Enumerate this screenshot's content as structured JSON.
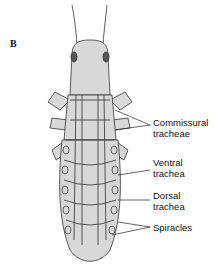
{
  "figure": {
    "panel_label": "B",
    "labels": [
      {
        "id": "commissural",
        "line1": "Commissural",
        "line2": "tracheae"
      },
      {
        "id": "ventral",
        "line1": "Ventral",
        "line2": "trachea"
      },
      {
        "id": "dorsal",
        "line1": "Dorsal",
        "line2": "trachea"
      },
      {
        "id": "spiracles",
        "line1": "Spiracles",
        "line2": ""
      }
    ]
  }
}
